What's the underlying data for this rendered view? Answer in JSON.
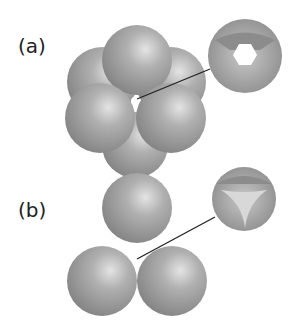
{
  "panels": [
    {
      "label": "(a)",
      "description": "octahedral hole between six spheres"
    },
    {
      "label": "(b)",
      "description": "tetrahedral hole between spheres"
    }
  ],
  "colors": {
    "sphere": "#9a9a9a",
    "highlight": "#dcdcdc",
    "line": "#222222"
  }
}
